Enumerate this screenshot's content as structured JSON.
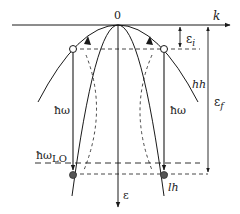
{
  "diagram": {
    "type": "band-structure-phonon-emission",
    "axes": {
      "k_label": "k",
      "origin_label": "0",
      "energy_label": "ε"
    },
    "bands": [
      {
        "name": "heavy-hole",
        "label": "hh"
      },
      {
        "name": "light-hole",
        "label": "lh"
      }
    ],
    "energy_labels": {
      "initial": "ε",
      "initial_sub": "i",
      "final": "ε",
      "final_sub": "f"
    },
    "phonon_labels": {
      "left": "ħω",
      "right": "ħω",
      "lo": "ħω",
      "lo_sub": "LO"
    },
    "colors": {
      "line": "#1a1a1a",
      "filled_state": "#555555",
      "empty_state": "#ffffff"
    }
  }
}
